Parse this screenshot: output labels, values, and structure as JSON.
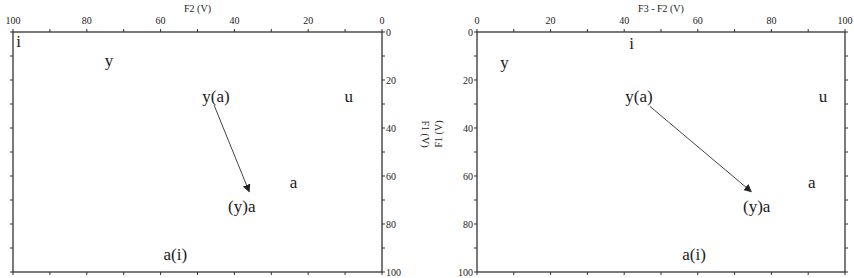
{
  "chart_data": [
    {
      "type": "scatter",
      "title": "",
      "xlabel": "F2 (V)",
      "xlabel_sub": "2",
      "ylabel": "F1 (V)",
      "ylabel_sub": "1",
      "xlim": [
        100,
        0
      ],
      "ylim": [
        0,
        100
      ],
      "x_axis_position": "top",
      "y_axis_position": "right",
      "x_reversed": true,
      "y_reversed": true,
      "xticks": [
        100,
        80,
        60,
        40,
        20,
        0
      ],
      "yticks": [
        0,
        20,
        40,
        60,
        80,
        100
      ],
      "grid": false,
      "points": [
        {
          "label": "i",
          "x": 98.5,
          "y": 4
        },
        {
          "label": "y",
          "x": 74,
          "y": 12
        },
        {
          "label": "y(a)",
          "x": 45,
          "y": 27
        },
        {
          "label": "u",
          "x": 9,
          "y": 27
        },
        {
          "label": "a",
          "x": 24,
          "y": 63
        },
        {
          "label": "(y)a",
          "x": 38,
          "y": 73
        },
        {
          "label": "a(i)",
          "x": 56,
          "y": 93
        }
      ],
      "arrows": [
        {
          "from": [
            45.5,
            30.5
          ],
          "to": [
            36,
            66.5
          ]
        }
      ]
    },
    {
      "type": "scatter",
      "title": "",
      "xlabel": "F3 - F2 (V)",
      "ylabel": "F1 (V)",
      "xlim": [
        0,
        100
      ],
      "ylim": [
        0,
        100
      ],
      "x_axis_position": "top",
      "y_axis_position": "left",
      "x_reversed": false,
      "y_reversed": true,
      "xticks": [
        0,
        20,
        40,
        60,
        80,
        100
      ],
      "yticks": [
        0,
        20,
        40,
        60,
        80,
        100
      ],
      "grid": false,
      "points": [
        {
          "label": "i",
          "x": 42,
          "y": 5
        },
        {
          "label": "y",
          "x": 7.5,
          "y": 13
        },
        {
          "label": "y(a)",
          "x": 44,
          "y": 27
        },
        {
          "label": "u",
          "x": 94,
          "y": 27
        },
        {
          "label": "a",
          "x": 91,
          "y": 63
        },
        {
          "label": "(y)a",
          "x": 76,
          "y": 73
        },
        {
          "label": "a(i)",
          "x": 59,
          "y": 93
        }
      ],
      "arrows": [
        {
          "from": [
            47,
            31
          ],
          "to": [
            74.5,
            66.5
          ]
        }
      ]
    }
  ]
}
